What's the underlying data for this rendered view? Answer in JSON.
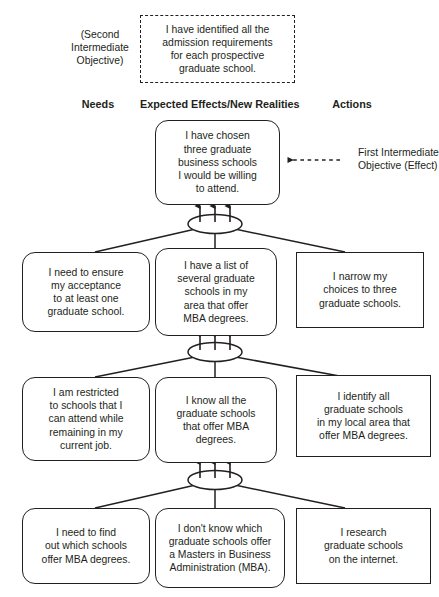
{
  "diagram": {
    "title_labels": {
      "second_intermediate_objective": "(Second\nIntermediate\nObjective)",
      "first_intermediate_objective": "First Intermediate\nObjective (Effect)"
    },
    "column_headers": [
      {
        "id": "needs",
        "label": "Needs"
      },
      {
        "id": "expected-effects",
        "label": "Expected Effects/New Realities"
      },
      {
        "id": "actions",
        "label": "Actions"
      }
    ],
    "nodes": {
      "second_objective": "I have identified all the\nadmission requirements\nfor each prospective\ngraduate school.",
      "first_objective": "I have chosen\nthree graduate\nbusiness schools\nI would be willing\nto attend.",
      "row2_need": "I need to ensure\nmy acceptance\nto at least one\ngraduate school.",
      "row2_effect": "I have a list of\nseveral graduate\nschools in my\narea that offer\nMBA degrees.",
      "row2_action": "I narrow my\nchoices to three\ngraduate schools.",
      "row3_need": "I am restricted\nto schools that I\ncan attend while\nremaining in my\ncurrent job.",
      "row3_effect": "I know all the\ngraduate schools\nthat offer MBA\ndegrees.",
      "row3_action": "I identify all\ngraduate schools\nin my local area that\noffer MBA degrees.",
      "row4_need": "I need to find\nout which schools\noffer MBA degrees.",
      "row4_effect": "I don't know which\ngraduate schools offer\na Masters in Business\nAdministration (MBA).",
      "row4_action": "I research\ngraduate schools\non the internet."
    },
    "colors": {
      "line": "#231f20",
      "text": "#231f20",
      "background": "#ffffff"
    }
  }
}
